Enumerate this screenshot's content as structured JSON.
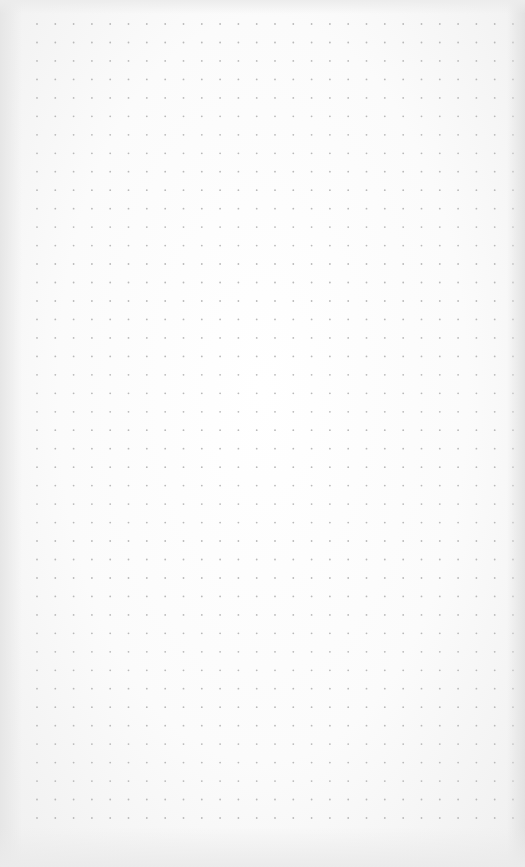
{
  "page": {
    "type": "dot-grid paper",
    "paper_color": "#fbfbfb",
    "dot_color": "#b9b9b9",
    "grid": {
      "columns": 27,
      "rows": 44
    }
  }
}
